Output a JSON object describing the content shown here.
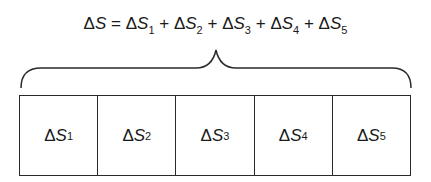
{
  "equation": {
    "lhs": "S",
    "delta": "Δ",
    "equals": "=",
    "plus": "+",
    "terms": [
      {
        "symbol": "S",
        "sub": "1"
      },
      {
        "symbol": "S",
        "sub": "2"
      },
      {
        "symbol": "S",
        "sub": "3"
      },
      {
        "symbol": "S",
        "sub": "4"
      },
      {
        "symbol": "S",
        "sub": "5"
      }
    ]
  },
  "boxes": [
    {
      "symbol": "S",
      "sub": "1"
    },
    {
      "symbol": "S",
      "sub": "2"
    },
    {
      "symbol": "S",
      "sub": "3"
    },
    {
      "symbol": "S",
      "sub": "4"
    },
    {
      "symbol": "S",
      "sub": "5"
    }
  ],
  "colors": {
    "stroke": "#2a2a2a",
    "text": "#1a1a1a",
    "background": "#ffffff"
  }
}
